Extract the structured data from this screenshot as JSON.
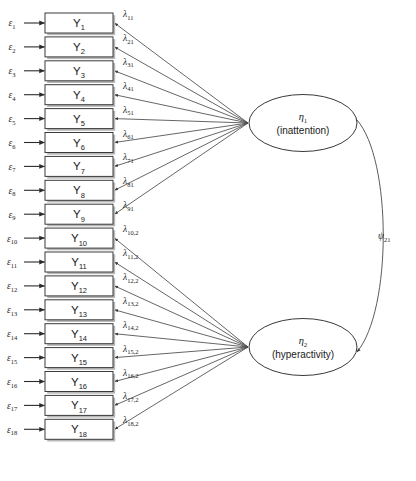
{
  "diagram": {
    "type": "sem-path-diagram",
    "title": "",
    "background_color": "#ffffff",
    "line_color": "#4a4a4a",
    "box_stroke_color": "#3a3a3a",
    "shadow_color": "#b8b8b8"
  },
  "indicators": [
    {
      "id": "y1",
      "label": "Y",
      "sub": "1",
      "error": "ε",
      "error_sub": "1",
      "loading": "λ",
      "loading_sub": "11",
      "factor": 1
    },
    {
      "id": "y2",
      "label": "Y",
      "sub": "2",
      "error": "ε",
      "error_sub": "2",
      "loading": "λ",
      "loading_sub": "21",
      "factor": 1
    },
    {
      "id": "y3",
      "label": "Y",
      "sub": "3",
      "error": "ε",
      "error_sub": "3",
      "loading": "λ",
      "loading_sub": "31",
      "factor": 1
    },
    {
      "id": "y4",
      "label": "Y",
      "sub": "4",
      "error": "ε",
      "error_sub": "4",
      "loading": "λ",
      "loading_sub": "41",
      "factor": 1
    },
    {
      "id": "y5",
      "label": "Y",
      "sub": "5",
      "error": "ε",
      "error_sub": "5",
      "loading": "λ",
      "loading_sub": "51",
      "factor": 1
    },
    {
      "id": "y6",
      "label": "Y",
      "sub": "6",
      "error": "ε",
      "error_sub": "6",
      "loading": "λ",
      "loading_sub": "61",
      "factor": 1
    },
    {
      "id": "y7",
      "label": "Y",
      "sub": "7",
      "error": "ε",
      "error_sub": "7",
      "loading": "λ",
      "loading_sub": "71",
      "factor": 1
    },
    {
      "id": "y8",
      "label": "Y",
      "sub": "8",
      "error": "ε",
      "error_sub": "8",
      "loading": "λ",
      "loading_sub": "81",
      "factor": 1
    },
    {
      "id": "y9",
      "label": "Y",
      "sub": "9",
      "error": "ε",
      "error_sub": "9",
      "loading": "λ",
      "loading_sub": "91",
      "factor": 1
    },
    {
      "id": "y10",
      "label": "Y",
      "sub": "10",
      "error": "ε",
      "error_sub": "10",
      "loading": "λ",
      "loading_sub": "10,2",
      "factor": 2
    },
    {
      "id": "y11",
      "label": "Y",
      "sub": "11",
      "error": "ε",
      "error_sub": "11",
      "loading": "λ",
      "loading_sub": "11,2",
      "factor": 2
    },
    {
      "id": "y12",
      "label": "Y",
      "sub": "12",
      "error": "ε",
      "error_sub": "12",
      "loading": "λ",
      "loading_sub": "12,2",
      "factor": 2
    },
    {
      "id": "y13",
      "label": "Y",
      "sub": "13",
      "error": "ε",
      "error_sub": "13",
      "loading": "λ",
      "loading_sub": "13,2",
      "factor": 2
    },
    {
      "id": "y14",
      "label": "Y",
      "sub": "14",
      "error": "ε",
      "error_sub": "14",
      "loading": "λ",
      "loading_sub": "14,2",
      "factor": 2
    },
    {
      "id": "y15",
      "label": "Y",
      "sub": "15",
      "error": "ε",
      "error_sub": "15",
      "loading": "λ",
      "loading_sub": "15,2",
      "factor": 2
    },
    {
      "id": "y16",
      "label": "Y",
      "sub": "16",
      "error": "ε",
      "error_sub": "16",
      "loading": "λ",
      "loading_sub": "16,2",
      "factor": 2
    },
    {
      "id": "y17",
      "label": "Y",
      "sub": "17",
      "error": "ε",
      "error_sub": "17",
      "loading": "λ",
      "loading_sub": "17,2",
      "factor": 2
    },
    {
      "id": "y18",
      "label": "Y",
      "sub": "18",
      "error": "ε",
      "error_sub": "18",
      "loading": "λ",
      "loading_sub": "18,2",
      "factor": 2
    }
  ],
  "factors": [
    {
      "id": "eta1",
      "symbol": "η",
      "sub": "1",
      "name": "(inattention)"
    },
    {
      "id": "eta2",
      "symbol": "η",
      "sub": "2",
      "name": "(hyperactivity)"
    }
  ],
  "covariance": {
    "symbol": "ψ",
    "sub": "21",
    "between": [
      "eta1",
      "eta2"
    ]
  }
}
